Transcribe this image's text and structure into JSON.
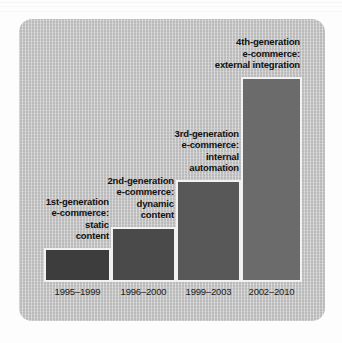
{
  "figure": {
    "panel_background": "#c5c5c5",
    "outer_background": "#fdfdfd",
    "bar_border_color": "#f2f2f2"
  },
  "chart_data": {
    "type": "bar",
    "title": "",
    "xlabel": "",
    "ylabel": "",
    "grid": false,
    "legend": "none",
    "categories": [
      "1995–1999",
      "1996–2000",
      "1999–2003",
      "2002–2010"
    ],
    "values": [
      34,
      55,
      102,
      205
    ],
    "ylim": [
      0,
      207
    ],
    "bar_colors": [
      "#3d3d3d",
      "#4a4a4a",
      "#585858",
      "#6b6b6b"
    ],
    "annotations": [
      "1st-generation\ne-commerce:\nstatic\ncontent",
      "2nd-generation\ne-commerce:\ndynamic\ncontent",
      "3rd-generation\ne-commerce:\ninternal\nautomation",
      "4th-generation\ne-commerce:\nexternal integration"
    ],
    "bars": [
      {
        "category": "1995–1999",
        "value": 34,
        "color": "#3d3d3d",
        "caption_lines": [
          "1st-generation",
          "e-commerce:",
          "static",
          "content"
        ]
      },
      {
        "category": "1996–2000",
        "value": 55,
        "color": "#4a4a4a",
        "caption_lines": [
          "2nd-generation",
          "e-commerce:",
          "dynamic",
          "content"
        ]
      },
      {
        "category": "1999–2003",
        "value": 102,
        "color": "#585858",
        "caption_lines": [
          "3rd-generation",
          "e-commerce:",
          "internal",
          "automation"
        ]
      },
      {
        "category": "2002–2010",
        "value": 205,
        "color": "#6b6b6b",
        "caption_lines": [
          "4th-generation",
          "e-commerce:",
          "external integration"
        ]
      }
    ]
  }
}
